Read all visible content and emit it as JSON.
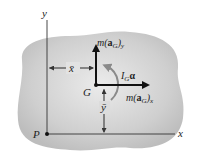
{
  "diagram": {
    "axes": {
      "x_label": "x",
      "y_label": "y",
      "origin_label": "P"
    },
    "center_of_mass": {
      "label": "G"
    },
    "dimensions": {
      "x_bar": "x̄",
      "y_bar": "ȳ"
    },
    "forces": {
      "m_aG_y": {
        "prefix": "m(",
        "vec": "a",
        "sub": "G",
        "suffix": ")",
        "axis_sub": "y"
      },
      "m_aG_x": {
        "prefix": "m(",
        "vec": "a",
        "sub": "G",
        "suffix": ")",
        "axis_sub": "x"
      }
    },
    "moment": {
      "I": "I",
      "sub": "G",
      "alpha": "α"
    },
    "colors": {
      "body_fill": "#c8c8c8",
      "line": "#222222"
    }
  }
}
